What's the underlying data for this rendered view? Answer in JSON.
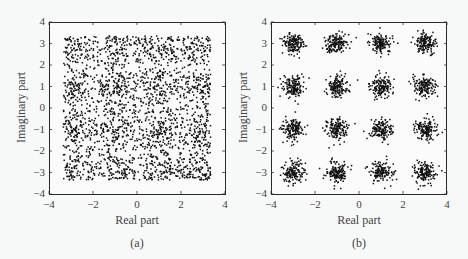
{
  "chart_data": [
    {
      "type": "scatter",
      "panel": "(a)",
      "caption": "(a)",
      "title": "",
      "xlabel": "Real part",
      "ylabel": "Imaginary part",
      "xlim": [
        -4,
        4
      ],
      "ylim": [
        -4,
        4
      ],
      "xticks": [
        -4,
        -2,
        0,
        2,
        4
      ],
      "yticks": [
        -4,
        -3,
        -2,
        -1,
        0,
        1,
        2,
        3,
        4
      ],
      "xtick_labels": [
        "−4",
        "−2",
        "0",
        "2",
        "4"
      ],
      "ytick_labels": [
        "−4",
        "−3",
        "−2",
        "−1",
        "0",
        "1",
        "2",
        "3",
        "4"
      ],
      "grid": false,
      "legend": null,
      "description": "Dense cloud of received symbols; clusters merged by heavy noise, spread roughly over [-3.3, 3.3] in both axes",
      "generator": {
        "centers": [
          -3,
          -1,
          1,
          3
        ],
        "sigma": 0.62,
        "points_per_cluster": 200,
        "clip": 3.35,
        "seed": 17
      },
      "marker_size": 1.5,
      "color": "#111111"
    },
    {
      "type": "scatter",
      "panel": "(b)",
      "caption": "(b)",
      "title": "",
      "xlabel": "Real part",
      "ylabel": "Imaginary part",
      "xlim": [
        -4,
        4
      ],
      "ylim": [
        -4,
        4
      ],
      "xticks": [
        -4,
        -2,
        0,
        2,
        4
      ],
      "yticks": [
        -4,
        -3,
        -2,
        -1,
        0,
        1,
        2,
        3,
        4
      ],
      "xtick_labels": [
        "−4",
        "−2",
        "0",
        "2",
        "4"
      ],
      "ytick_labels": [
        "−4",
        "−3",
        "−2",
        "−1",
        "0",
        "1",
        "2",
        "3",
        "4"
      ],
      "grid": false,
      "legend": null,
      "description": "16-point constellation: 4x4 grid of noisy clusters centered at real/imag in {-3,-1,1,3}",
      "clusters": [
        {
          "x": -3,
          "y": 3
        },
        {
          "x": -1,
          "y": 3
        },
        {
          "x": 1,
          "y": 3
        },
        {
          "x": 3,
          "y": 3
        },
        {
          "x": -3,
          "y": 1
        },
        {
          "x": -1,
          "y": 1
        },
        {
          "x": 1,
          "y": 1
        },
        {
          "x": 3,
          "y": 1
        },
        {
          "x": -3,
          "y": -1
        },
        {
          "x": -1,
          "y": -1
        },
        {
          "x": 1,
          "y": -1
        },
        {
          "x": 3,
          "y": -1
        },
        {
          "x": -3,
          "y": -3
        },
        {
          "x": -1,
          "y": -3
        },
        {
          "x": 1,
          "y": -3
        },
        {
          "x": 3,
          "y": -3
        }
      ],
      "generator": {
        "sigma": 0.25,
        "points_per_cluster": 150,
        "seed": 42
      },
      "marker_size": 1.5,
      "color": "#111111"
    }
  ]
}
